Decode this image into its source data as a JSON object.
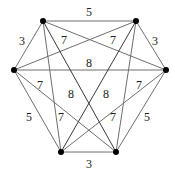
{
  "diagram": {
    "type": "weighted-complete-graph",
    "vertices": [
      {
        "id": "A",
        "name": "top-left",
        "x": 43,
        "y": 21
      },
      {
        "id": "B",
        "name": "top-right",
        "x": 136,
        "y": 21
      },
      {
        "id": "C",
        "name": "left",
        "x": 14,
        "y": 70
      },
      {
        "id": "D",
        "name": "right",
        "x": 166,
        "y": 70
      },
      {
        "id": "E",
        "name": "bottom-left",
        "x": 61,
        "y": 152
      },
      {
        "id": "F",
        "name": "bottom-right",
        "x": 116,
        "y": 152
      }
    ],
    "edges": [
      {
        "from": "A",
        "to": "B",
        "weight": "5",
        "lx": 89,
        "ly": 12
      },
      {
        "from": "A",
        "to": "C",
        "weight": "3",
        "lx": 22,
        "ly": 41
      },
      {
        "from": "B",
        "to": "D",
        "weight": "3",
        "lx": 155,
        "ly": 41
      },
      {
        "from": "A",
        "to": "D",
        "weight": "7",
        "lx": 64,
        "ly": 40
      },
      {
        "from": "B",
        "to": "C",
        "weight": "7",
        "lx": 113,
        "ly": 40
      },
      {
        "from": "C",
        "to": "D",
        "weight": "8",
        "lx": 89,
        "ly": 63
      },
      {
        "from": "C",
        "to": "F",
        "weight": "7",
        "lx": 40,
        "ly": 85
      },
      {
        "from": "D",
        "to": "E",
        "weight": "7",
        "lx": 139,
        "ly": 85
      },
      {
        "from": "A",
        "to": "F",
        "weight": "8",
        "lx": 71,
        "ly": 94
      },
      {
        "from": "B",
        "to": "E",
        "weight": "8",
        "lx": 106,
        "ly": 94
      },
      {
        "from": "C",
        "to": "E",
        "weight": "5",
        "lx": 29,
        "ly": 117
      },
      {
        "from": "D",
        "to": "F",
        "weight": "5",
        "lx": 147,
        "ly": 117
      },
      {
        "from": "A",
        "to": "E",
        "weight": "7",
        "lx": 61,
        "ly": 117
      },
      {
        "from": "B",
        "to": "F",
        "weight": "7",
        "lx": 113,
        "ly": 117
      },
      {
        "from": "E",
        "to": "F",
        "weight": "3",
        "lx": 89,
        "ly": 164
      }
    ]
  }
}
